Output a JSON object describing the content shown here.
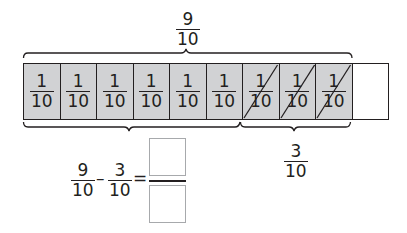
{
  "colors": {
    "shaded_cell": "#d1d2d4",
    "empty_cell": "#ffffff",
    "line": "#231f20",
    "answer_box_border": "#a7a9ac"
  },
  "top_label": {
    "numerator": "9",
    "denominator": "10"
  },
  "tape": {
    "cells": [
      {
        "numerator": "1",
        "denominator": "10",
        "shaded": true,
        "crossed": false
      },
      {
        "numerator": "1",
        "denominator": "10",
        "shaded": true,
        "crossed": false
      },
      {
        "numerator": "1",
        "denominator": "10",
        "shaded": true,
        "crossed": false
      },
      {
        "numerator": "1",
        "denominator": "10",
        "shaded": true,
        "crossed": false
      },
      {
        "numerator": "1",
        "denominator": "10",
        "shaded": true,
        "crossed": false
      },
      {
        "numerator": "1",
        "denominator": "10",
        "shaded": true,
        "crossed": false
      },
      {
        "numerator": "1",
        "denominator": "10",
        "shaded": true,
        "crossed": true
      },
      {
        "numerator": "1",
        "denominator": "10",
        "shaded": true,
        "crossed": true
      },
      {
        "numerator": "1",
        "denominator": "10",
        "shaded": true,
        "crossed": true
      },
      {
        "numerator": "",
        "denominator": "",
        "shaded": false,
        "crossed": false
      }
    ]
  },
  "bottom_right_label": {
    "numerator": "3",
    "denominator": "10"
  },
  "equation": {
    "term1": {
      "numerator": "9",
      "denominator": "10"
    },
    "operator": "–",
    "term2": {
      "numerator": "3",
      "denominator": "10"
    },
    "equals": "=",
    "answer": {
      "numerator": "",
      "denominator": ""
    }
  }
}
